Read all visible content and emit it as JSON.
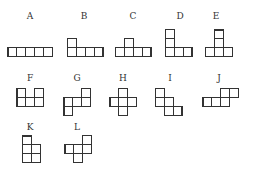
{
  "figure": {
    "title": "",
    "cell_size": 9,
    "shapes": [
      {
        "id": "A",
        "label": "A",
        "label_pos": [
          30,
          12
        ],
        "cells": [
          [
            7,
            47
          ],
          [
            16,
            47
          ],
          [
            25,
            47
          ],
          [
            34,
            47
          ],
          [
            43,
            47
          ]
        ],
        "thick": {
          "0": "left"
        }
      },
      {
        "id": "B",
        "label": "B",
        "label_pos": [
          84,
          12
        ],
        "cells": [
          [
            67,
            38
          ],
          [
            67,
            47
          ],
          [
            76,
            47
          ],
          [
            85,
            47
          ],
          [
            94,
            47
          ]
        ],
        "thick": {
          "4": "right"
        }
      },
      {
        "id": "C",
        "label": "C",
        "label_pos": [
          133,
          12
        ],
        "cells": [
          [
            124,
            38
          ],
          [
            115,
            47
          ],
          [
            124,
            47
          ],
          [
            133,
            47
          ],
          [
            142,
            47
          ]
        ],
        "thick": {
          "4": "right"
        }
      },
      {
        "id": "D",
        "label": "D",
        "label_pos": [
          180,
          12
        ],
        "cells": [
          [
            165,
            29
          ],
          [
            165,
            38
          ],
          [
            165,
            47
          ],
          [
            174,
            47
          ],
          [
            183,
            47
          ]
        ],
        "thick": {
          "4": "right"
        }
      },
      {
        "id": "E",
        "label": "E",
        "label_pos": [
          216,
          12
        ],
        "cells": [
          [
            214,
            29
          ],
          [
            214,
            38
          ],
          [
            205,
            47
          ],
          [
            214,
            47
          ],
          [
            223,
            47
          ]
        ],
        "thick": {
          "0": "top"
        }
      },
      {
        "id": "F",
        "label": "F",
        "label_pos": [
          30,
          74
        ],
        "cells": [
          [
            16,
            88
          ],
          [
            34,
            88
          ],
          [
            16,
            97
          ],
          [
            25,
            97
          ],
          [
            34,
            97
          ]
        ],
        "thick": {
          "0": "left",
          "2": "left"
        }
      },
      {
        "id": "G",
        "label": "G",
        "label_pos": [
          77,
          74
        ],
        "cells": [
          [
            81,
            88
          ],
          [
            63,
            97
          ],
          [
            72,
            97
          ],
          [
            81,
            97
          ],
          [
            63,
            106
          ]
        ],
        "thick": {
          "1": "left",
          "4": "left"
        }
      },
      {
        "id": "H",
        "label": "H",
        "label_pos": [
          123,
          74
        ],
        "cells": [
          [
            118,
            88
          ],
          [
            109,
            97
          ],
          [
            118,
            97
          ],
          [
            127,
            97
          ],
          [
            118,
            106
          ]
        ],
        "thick": {
          "1": "left"
        }
      },
      {
        "id": "I",
        "label": "I",
        "label_pos": [
          170,
          74
        ],
        "cells": [
          [
            155,
            88
          ],
          [
            155,
            97
          ],
          [
            164,
            97
          ],
          [
            164,
            106
          ],
          [
            173,
            106
          ]
        ],
        "thick": {
          "4": "right"
        }
      },
      {
        "id": "J",
        "label": "J",
        "label_pos": [
          219,
          74
        ],
        "cells": [
          [
            220,
            88
          ],
          [
            229,
            88
          ],
          [
            202,
            97
          ],
          [
            211,
            97
          ],
          [
            220,
            97
          ]
        ],
        "thick": {
          "2": "left"
        }
      },
      {
        "id": "K",
        "label": "K",
        "label_pos": [
          30,
          123
        ],
        "cells": [
          [
            22,
            135
          ],
          [
            22,
            144
          ],
          [
            31,
            144
          ],
          [
            22,
            153
          ],
          [
            31,
            153
          ]
        ],
        "thick": {
          "0": "top"
        }
      },
      {
        "id": "L",
        "label": "L",
        "label_pos": [
          77,
          123
        ],
        "cells": [
          [
            82,
            135
          ],
          [
            64,
            144
          ],
          [
            73,
            144
          ],
          [
            82,
            144
          ],
          [
            73,
            153
          ]
        ],
        "thick": {
          "1": "left"
        }
      }
    ]
  }
}
